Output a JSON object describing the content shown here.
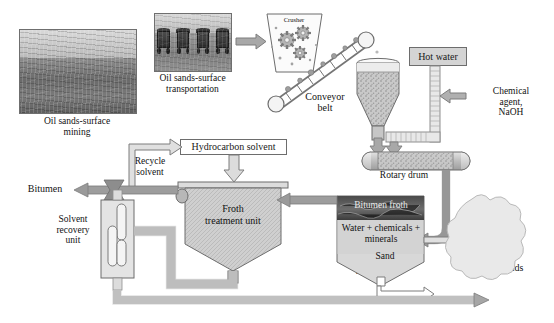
{
  "diagram": {
    "type": "process-flow"
  },
  "photos": [
    {
      "name": "oil-sands-surface-mining",
      "caption": "Oil sands-surface\nmining"
    },
    {
      "name": "oil-sands-surface-transportation",
      "caption": "Oil sands-surface\ntransportation"
    }
  ],
  "units": {
    "crusher": "Crusher",
    "conveyor": "Conveyor\nbelt",
    "hot_water": "Hot water",
    "chemical_agent": "Chemical\nagent,\nNaOH",
    "rotary_drum": "Rotary drum",
    "hydrocarbon_solvent": "Hydrocarbon solvent",
    "recycle_solvent": "Recycle\nsolvent",
    "froth_treatment_unit": "Froth\ntreatment unit",
    "solvent_recovery_unit": "Solvent\nrecovery\nunit",
    "bitumen": "Bitumen",
    "separator": "Separator",
    "bitumen_froth": "Bitumen froth",
    "water_chemicals_minerals": "Water + chemicals +\nminerals",
    "sand": "Sand",
    "tailing_ponds": "Tailing ponds"
  },
  "colors": {
    "pipe_fill": "#cfcfcf",
    "pipe_stroke": "#8f8f8f",
    "arrow_dark": "#9a9a9a",
    "arrow_outline": "#7d7d7d",
    "vessel_fill": "#cccccc",
    "vessel_stroke": "#6d6d6d",
    "box_fill": "#d4d4d4",
    "pond_fill": "#e6e6e6",
    "text": "#121212"
  }
}
